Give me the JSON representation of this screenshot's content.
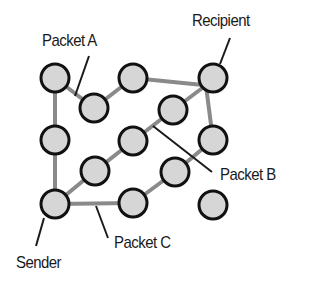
{
  "labels": {
    "recipient": "Recipient",
    "packet_a": "Packet A",
    "packet_b": "Packet B",
    "packet_c": "Packet C",
    "sender": "Sender"
  },
  "colors": {
    "node_fill": "#d6d6d6",
    "node_stroke": "#111111",
    "edge": "#8a8a8a",
    "leader": "#1a1a1a"
  },
  "nodes": [
    {
      "id": "n1",
      "x": 55,
      "y": 78
    },
    {
      "id": "n2",
      "x": 94,
      "y": 108
    },
    {
      "id": "n3",
      "x": 133,
      "y": 78
    },
    {
      "id": "recipient",
      "x": 213,
      "y": 78
    },
    {
      "id": "n5",
      "x": 173,
      "y": 110
    },
    {
      "id": "n6",
      "x": 55,
      "y": 140
    },
    {
      "id": "n7",
      "x": 133,
      "y": 141
    },
    {
      "id": "n8",
      "x": 213,
      "y": 140
    },
    {
      "id": "n9",
      "x": 95,
      "y": 171
    },
    {
      "id": "n10",
      "x": 175,
      "y": 172
    },
    {
      "id": "sender",
      "x": 55,
      "y": 204
    },
    {
      "id": "n12",
      "x": 133,
      "y": 203
    },
    {
      "id": "n13",
      "x": 213,
      "y": 205
    }
  ],
  "routes": {
    "packet_a": [
      "sender",
      "n6",
      "n1",
      "n2",
      "n3",
      "recipient"
    ],
    "packet_b": [
      "sender",
      "n9",
      "n7",
      "n5",
      "recipient"
    ],
    "packet_c": [
      "sender",
      "n12",
      "n10",
      "n8",
      "recipient"
    ]
  }
}
